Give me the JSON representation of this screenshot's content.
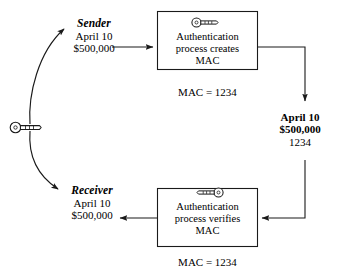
{
  "diagram": {
    "colors": {
      "stroke": "#1a1a1a",
      "background": "#ffffff",
      "text": "#000000"
    },
    "sender": {
      "role": "Sender",
      "date": "April 10",
      "amount": "$500,000"
    },
    "receiver": {
      "role": "Receiver",
      "date": "April 10",
      "amount": "$500,000"
    },
    "top_box": {
      "line1": "Authentication",
      "line2": "process creates",
      "line3": "MAC",
      "icon": "key-icon",
      "caption": "MAC = 1234"
    },
    "bottom_box": {
      "line1": "Authentication",
      "line2": "process verifies",
      "line3": "MAC",
      "icon": "key-icon-mirrored",
      "caption": "MAC = 1234"
    },
    "transmitted_message": {
      "date": "April 10",
      "amount": "$500,000",
      "mac": "1234"
    },
    "shared_key": {
      "icon": "key-icon",
      "label": ""
    }
  }
}
